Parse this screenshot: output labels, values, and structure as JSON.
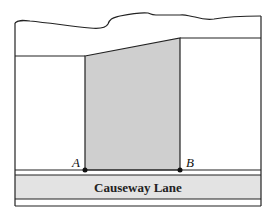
{
  "diagram": {
    "type": "property-plot-map",
    "road": {
      "label": "Causeway Lane",
      "fill": "#e3e3e3"
    },
    "shaded_lot": {
      "fill": "#cfcfcf"
    },
    "points": [
      {
        "label": "A",
        "x": 85,
        "y": 170
      },
      {
        "label": "B",
        "x": 180,
        "y": 170
      }
    ],
    "stroke_color": "#222222"
  }
}
